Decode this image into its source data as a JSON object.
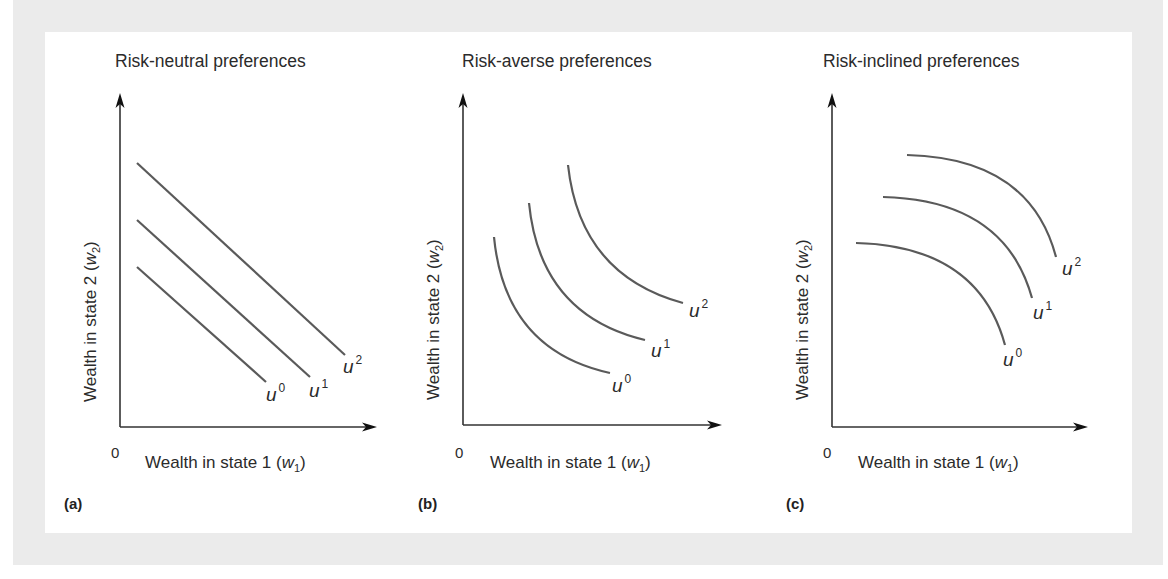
{
  "figure": {
    "background_color": "#ebebeb",
    "panel_color": "#ffffff",
    "curve_color": "#5a5a5a",
    "axis_color": "#333333",
    "panels": [
      {
        "tag": "(a)",
        "title": "Risk-neutral preferences",
        "xlabel": "Wealth in state 1 (",
        "xvar": "w",
        "xsub": "1",
        "ylabel": "Wealth in state 2 (",
        "yvar": "w",
        "ysub": "2",
        "origin": "0",
        "shape": "linear",
        "curves": [
          {
            "name": "u",
            "sup": "0"
          },
          {
            "name": "u",
            "sup": "1"
          },
          {
            "name": "u",
            "sup": "2"
          }
        ]
      },
      {
        "tag": "(b)",
        "title": "Risk-averse preferences",
        "xlabel": "Wealth in state 1 (",
        "xvar": "w",
        "xsub": "1",
        "ylabel": "Wealth in state 2 (",
        "yvar": "w",
        "ysub": "2",
        "origin": "0",
        "shape": "convex",
        "curves": [
          {
            "name": "u",
            "sup": "0"
          },
          {
            "name": "u",
            "sup": "1"
          },
          {
            "name": "u",
            "sup": "2"
          }
        ]
      },
      {
        "tag": "(c)",
        "title": "Risk-inclined preferences",
        "xlabel": "Wealth in state 1 (",
        "xvar": "w",
        "xsub": "1",
        "ylabel": "Wealth in state 2 (",
        "yvar": "w",
        "ysub": "2",
        "origin": "0",
        "shape": "concave",
        "curves": [
          {
            "name": "u",
            "sup": "0"
          },
          {
            "name": "u",
            "sup": "1"
          },
          {
            "name": "u",
            "sup": "2"
          }
        ]
      }
    ]
  }
}
